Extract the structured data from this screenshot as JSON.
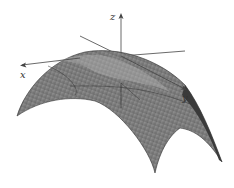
{
  "figure": {
    "axes": {
      "x_label": "x",
      "y_label": "y",
      "z_label": "z"
    },
    "colors": {
      "surface_fill": "#8a8a8a",
      "mesh_lines": "#3a3a3a",
      "axis_lines": "#444444",
      "background": "#ffffff"
    }
  }
}
